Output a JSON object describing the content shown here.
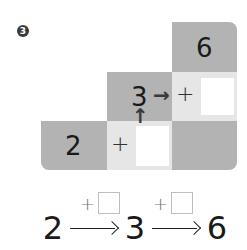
{
  "problem_number": "3",
  "grid": {
    "top": {
      "value": "6"
    },
    "middle": {
      "left_value": "3",
      "right_op": "+"
    },
    "bottom": {
      "left_value": "2",
      "middle_op": "+"
    }
  },
  "arrows": {
    "up": "↑",
    "right": "→"
  },
  "chain": {
    "start": "2",
    "middle": "3",
    "end": "6",
    "ops": [
      "+",
      "+"
    ]
  },
  "colors": {
    "dark_cell": "#b3b3b3",
    "light_cell": "#e6e6e6",
    "answer_box": "#ffffff"
  }
}
